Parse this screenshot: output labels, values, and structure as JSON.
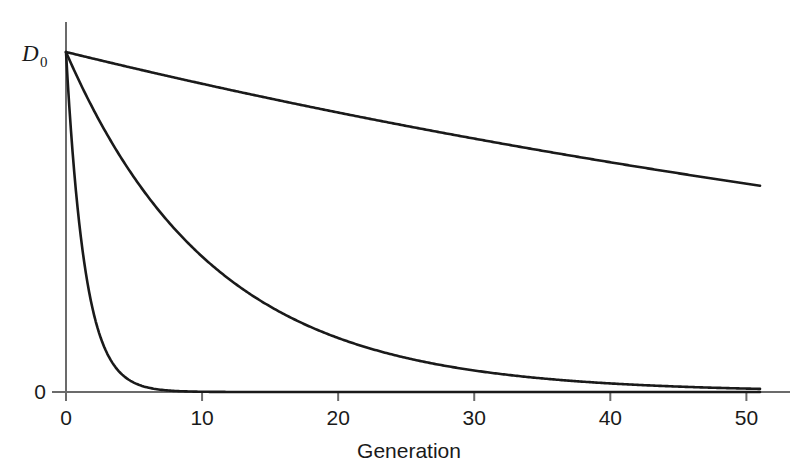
{
  "chart_data": {
    "type": "line",
    "title": "",
    "subtitle": "",
    "xlabel": "Generation",
    "ylabel": "D",
    "ylabel_sub": "0",
    "grid": false,
    "legend": false,
    "legend_position": "none",
    "xlim": [
      0,
      51
    ],
    "ylim": [
      0,
      1
    ],
    "xticks": [
      0,
      10,
      20,
      30,
      40,
      50
    ],
    "xtick_labels": [
      "0",
      "10",
      "20",
      "30",
      "40",
      "50"
    ],
    "yticks": [
      0,
      1
    ],
    "ytick_labels": [
      "0",
      "D₀"
    ],
    "y_axis_note": "Vertical axis spans 0 at the baseline to D0 at the top; only these two values are labeled.",
    "line_color": "#1a1a1a",
    "axis_color": "#555555",
    "x": [
      0,
      1,
      2,
      3,
      4,
      5,
      6,
      7,
      8,
      9,
      10,
      12,
      14,
      16,
      18,
      20,
      22,
      24,
      26,
      28,
      30,
      32,
      34,
      36,
      38,
      40,
      42,
      44,
      46,
      48,
      50,
      51
    ],
    "series": [
      {
        "name": "slow decay",
        "decay_rate": 0.0098,
        "values": [
          1.0,
          0.99,
          0.981,
          0.971,
          0.961,
          0.952,
          0.943,
          0.933,
          0.924,
          0.915,
          0.907,
          0.889,
          0.872,
          0.855,
          0.838,
          0.822,
          0.806,
          0.791,
          0.776,
          0.761,
          0.746,
          0.731,
          0.717,
          0.704,
          0.69,
          0.677,
          0.664,
          0.651,
          0.638,
          0.626,
          0.614,
          0.608
        ]
      },
      {
        "name": "medium decay",
        "decay_rate": 0.092,
        "values": [
          1.0,
          0.912,
          0.832,
          0.759,
          0.692,
          0.631,
          0.576,
          0.525,
          0.479,
          0.437,
          0.398,
          0.332,
          0.276,
          0.23,
          0.191,
          0.159,
          0.132,
          0.11,
          0.092,
          0.076,
          0.064,
          0.053,
          0.044,
          0.037,
          0.03,
          0.025,
          0.021,
          0.018,
          0.015,
          0.012,
          0.01,
          0.009
        ]
      },
      {
        "name": "fast decay",
        "decay_rate": 0.72,
        "values": [
          1.0,
          0.487,
          0.237,
          0.115,
          0.056,
          0.027,
          0.013,
          0.0065,
          0.0032,
          0.0015,
          0.00075,
          0.00018,
          4e-05,
          1e-05,
          0.0,
          0.0,
          0.0,
          0.0,
          0.0,
          0.0,
          0.0,
          0.0,
          0.0,
          0.0,
          0.0,
          0.0,
          0.0,
          0.0,
          0.0,
          0.0,
          0.0,
          0.0
        ]
      }
    ],
    "annotations": []
  }
}
